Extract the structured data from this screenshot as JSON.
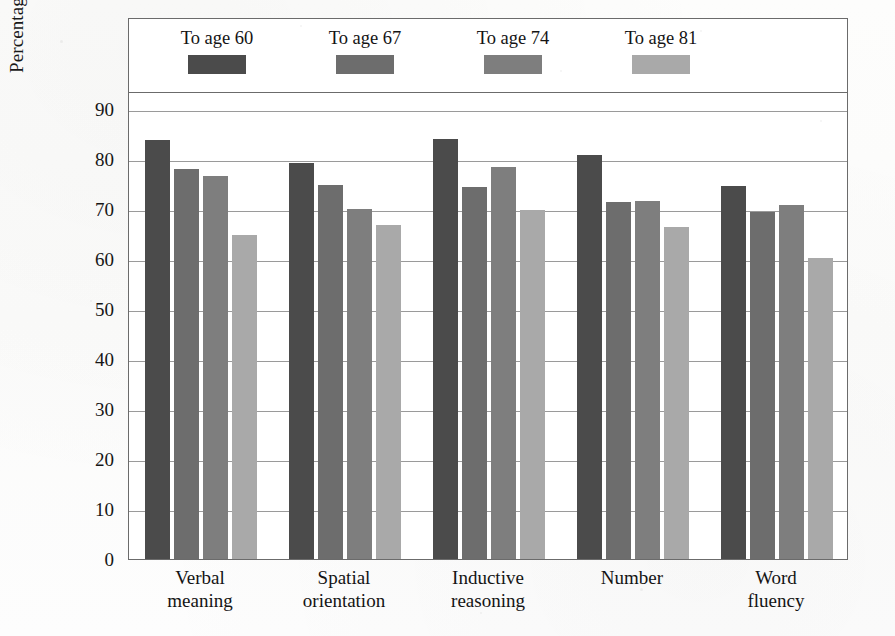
{
  "chart_data": {
    "type": "bar",
    "title": "",
    "subtitle": "",
    "xlabel": "",
    "ylabel": "Percentage maintaining over 7 years",
    "ylim": [
      0,
      90
    ],
    "ytick_values": [
      0,
      10,
      20,
      30,
      40,
      50,
      60,
      70,
      80,
      90
    ],
    "ytick_labels": [
      "0",
      "10",
      "20",
      "30",
      "40",
      "50",
      "60",
      "70",
      "80",
      "90"
    ],
    "grid": true,
    "legend_position": "top-inside",
    "categories": [
      "Verbal meaning",
      "Spatial orientation",
      "Inductive reasoning",
      "Number",
      "Word fluency"
    ],
    "category_lines": [
      [
        "Verbal",
        "meaning"
      ],
      [
        "Spatial",
        "orientation"
      ],
      [
        "Inductive",
        "reasoning"
      ],
      [
        "Number",
        ""
      ],
      [
        "Word",
        "fluency"
      ]
    ],
    "series": [
      {
        "name": "To age 60",
        "color": "#4b4b4b",
        "values": [
          83.9,
          79.3,
          84.1,
          80.8,
          74.6
        ]
      },
      {
        "name": "To age 67",
        "color": "#6d6d6d",
        "values": [
          78.0,
          74.9,
          74.5,
          71.4,
          69.4
        ]
      },
      {
        "name": "To age 74",
        "color": "#7e7e7e",
        "values": [
          76.6,
          70.0,
          78.4,
          71.6,
          70.9
        ]
      },
      {
        "name": "To age 81",
        "color": "#a9a9a9",
        "values": [
          64.8,
          66.9,
          69.8,
          66.5,
          60.3
        ]
      }
    ]
  },
  "legend": {
    "items": [
      {
        "label": "To age 60",
        "color": "#4b4b4b"
      },
      {
        "label": "To age 67",
        "color": "#6d6d6d"
      },
      {
        "label": "To age 74",
        "color": "#7e7e7e"
      },
      {
        "label": "To age 81",
        "color": "#a9a9a9"
      }
    ]
  },
  "colors": {
    "frame": "#6b6b6b",
    "gridline": "#9a9a9a",
    "text": "#141414",
    "background": "#fefefe"
  }
}
